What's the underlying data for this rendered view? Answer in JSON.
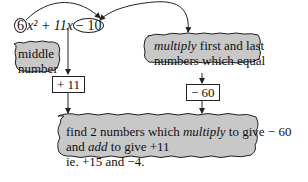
{
  "equation": {
    "coef_a": "6",
    "rest_1": "x² + 11x",
    "coef_c": "− 10"
  },
  "labels": {
    "middle_number_line1": "middle",
    "middle_number_line2": "number",
    "multiply_word": "multiply",
    "multiply_rest_line1": " first and last",
    "multiply_line2": "numbers which equal"
  },
  "boxes": {
    "middle_value": "+ 11",
    "product_value": "− 60"
  },
  "bottom_note": {
    "line1_pre": "find 2 numbers which ",
    "line1_italic": "multiply",
    "line1_post": " to give − 60",
    "line2_pre": "and ",
    "line2_italic": "add",
    "line2_post": " to give +11",
    "line3": "ie. +15 and −4."
  },
  "colors": {
    "cloud_fill": "#c8c8c8",
    "stroke": "#222222"
  }
}
